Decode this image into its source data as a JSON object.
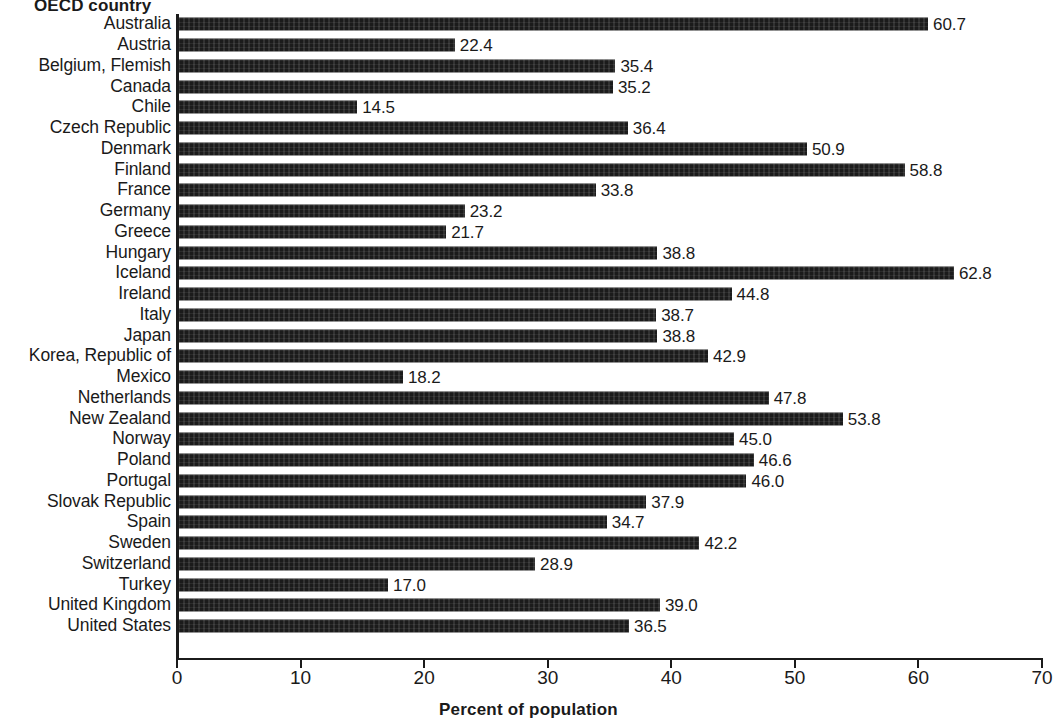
{
  "chart_data": {
    "type": "bar",
    "orientation": "horizontal",
    "title": "",
    "ylabel": "OECD country",
    "xlabel": "Percent of population",
    "xlim": [
      0,
      70
    ],
    "xticks": [
      0,
      10,
      20,
      30,
      40,
      50,
      60,
      70
    ],
    "grid": false,
    "legend": null,
    "bar_color": "#1b1b1b",
    "value_label_format": "one-decimal",
    "categories": [
      "Australia",
      "Austria",
      "Belgium, Flemish",
      "Canada",
      "Chile",
      "Czech Republic",
      "Denmark",
      "Finland",
      "France",
      "Germany",
      "Greece",
      "Hungary",
      "Iceland",
      "Ireland",
      "Italy",
      "Japan",
      "Korea, Republic of",
      "Mexico",
      "Netherlands",
      "New Zealand",
      "Norway",
      "Poland",
      "Portugal",
      "Slovak Republic",
      "Spain",
      "Sweden",
      "Switzerland",
      "Turkey",
      "United Kingdom",
      "United States"
    ],
    "values": [
      60.7,
      22.4,
      35.4,
      35.2,
      14.5,
      36.4,
      50.9,
      58.8,
      33.8,
      23.2,
      21.7,
      38.8,
      62.8,
      44.8,
      38.7,
      38.8,
      42.9,
      18.2,
      47.8,
      53.8,
      45.0,
      46.6,
      46.0,
      37.9,
      34.7,
      42.2,
      28.9,
      17.0,
      39.0,
      36.5
    ],
    "value_labels": [
      "60.7",
      "22.4",
      "35.4",
      "35.2",
      "14.5",
      "36.4",
      "50.9",
      "58.8",
      "33.8",
      "23.2",
      "21.7",
      "38.8",
      "62.8",
      "44.8",
      "38.7",
      "38.8",
      "42.9",
      "18.2",
      "47.8",
      "53.8",
      "45.0",
      "46.6",
      "46.0",
      "37.9",
      "34.7",
      "42.2",
      "28.9",
      "17.0",
      "39.0",
      "36.5"
    ],
    "xtick_labels": [
      "0",
      "10",
      "20",
      "30",
      "40",
      "50",
      "60",
      "70"
    ]
  }
}
